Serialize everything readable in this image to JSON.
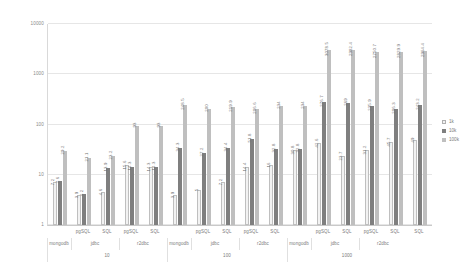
{
  "chart_data": {
    "type": "bar",
    "title": "",
    "subtitle": "",
    "xlabel": "",
    "ylabel": "",
    "yscale": "log",
    "ylim": [
      1,
      10000
    ],
    "grid": true,
    "legend_position": "right",
    "ytick_labels": [
      "1",
      "10",
      "100",
      "1000",
      "10000"
    ],
    "ytick_values": [
      1,
      10,
      100,
      1000,
      10000
    ],
    "legend": [
      "1k",
      "10k",
      "100k"
    ],
    "series": [
      {
        "name": "1k",
        "color": "#f2f2f2",
        "values": [
          7.2,
          3.9,
          4.6,
          15.6,
          14.3,
          3.9,
          5,
          7.2,
          14.4,
          16,
          30.8,
          42.6,
          23.7,
          31.2,
          45.7,
          49
        ]
      },
      {
        "name": "10k",
        "color": "#7f7f7f",
        "values": [
          7.6,
          4.2,
          13.9,
          14.3,
          14.3,
          34.3,
          27.2,
          34.4,
          51.8,
          32.8,
          32.8,
          276.7,
          269,
          235.9,
          206.3,
          243.2
        ]
      },
      {
        "name": "100k",
        "color": "#bfbfbf",
        "values": [
          29.2,
          21.1,
          23.2,
          93,
          93,
          248.5,
          200,
          219.9,
          206.6,
          234,
          234,
          3078.5,
          2982.4,
          2750.7,
          2829.9,
          2964.4
        ]
      }
    ],
    "groups": [
      {
        "label": "10",
        "drivers": [
          {
            "label": "mongodb",
            "dbs": [
              ""
            ],
            "span": 1
          },
          {
            "label": "jdbc",
            "dbs": [
              "pgSQL",
              "SQL"
            ],
            "span": 2
          },
          {
            "label": "r2dbc",
            "dbs": [
              "pgSQL",
              "SQL"
            ],
            "span": 2
          }
        ]
      },
      {
        "label": "100",
        "drivers": [
          {
            "label": "mongodb",
            "dbs": [
              ""
            ],
            "span": 1
          },
          {
            "label": "jdbc",
            "dbs": [
              "pgSQL",
              "SQL"
            ],
            "span": 2
          },
          {
            "label": "r2dbc",
            "dbs": [
              "pgSQL",
              "SQL"
            ],
            "span": 2
          }
        ]
      },
      {
        "label": "1000",
        "drivers": [
          {
            "label": "mongodb",
            "dbs": [
              ""
            ],
            "span": 1
          },
          {
            "label": "jdbc",
            "dbs": [
              "pgSQL",
              "SQL"
            ],
            "span": 2
          },
          {
            "label": "r2dbc",
            "dbs": [
              "pgSQL",
              "SQL"
            ],
            "span": 2
          }
        ]
      }
    ],
    "categories": [
      {
        "group": "10",
        "driver": "mongodb",
        "db": "",
        "values": [
          7.2,
          7.6,
          29.2
        ]
      },
      {
        "group": "10",
        "driver": "jdbc",
        "db": "pgSQL",
        "values": [
          3.9,
          4.2,
          21.1
        ]
      },
      {
        "group": "10",
        "driver": "jdbc",
        "db": "SQL",
        "values": [
          4.6,
          13.9,
          23.2
        ]
      },
      {
        "group": "10",
        "driver": "r2dbc",
        "db": "pgSQL",
        "values": [
          15.6,
          14.3,
          93
        ]
      },
      {
        "group": "10",
        "driver": "r2dbc",
        "db": "SQL",
        "values": [
          14.3,
          14.3,
          93
        ]
      },
      {
        "group": "100",
        "driver": "mongodb",
        "db": "",
        "values": [
          3.9,
          34.3,
          248.5
        ]
      },
      {
        "group": "100",
        "driver": "jdbc",
        "db": "pgSQL",
        "values": [
          5,
          27.2,
          200
        ]
      },
      {
        "group": "100",
        "driver": "jdbc",
        "db": "SQL",
        "values": [
          7.2,
          34.4,
          219.9
        ]
      },
      {
        "group": "100",
        "driver": "r2dbc",
        "db": "pgSQL",
        "values": [
          14.4,
          51.8,
          206.6
        ]
      },
      {
        "group": "100",
        "driver": "r2dbc",
        "db": "SQL",
        "values": [
          16,
          32.8,
          234
        ]
      },
      {
        "group": "1000",
        "driver": "mongodb",
        "db": "",
        "values": [
          30.8,
          32.8,
          234
        ]
      },
      {
        "group": "1000",
        "driver": "jdbc",
        "db": "pgSQL",
        "values": [
          42.6,
          276.7,
          3078.5
        ]
      },
      {
        "group": "1000",
        "driver": "jdbc",
        "db": "SQL",
        "values": [
          23.7,
          269,
          2982.4
        ]
      },
      {
        "group": "1000",
        "driver": "r2dbc",
        "db": "pgSQL",
        "values": [
          31.2,
          235.9,
          2750.7
        ]
      },
      {
        "group": "1000",
        "driver": "r2dbc",
        "db": "SQL",
        "values": [
          45.7,
          206.3,
          2829.9
        ]
      },
      {
        "group": "1000",
        "driver": "r2dbc",
        "db": "SQL2",
        "values": [
          49,
          243.2,
          2964.4
        ]
      }
    ]
  }
}
